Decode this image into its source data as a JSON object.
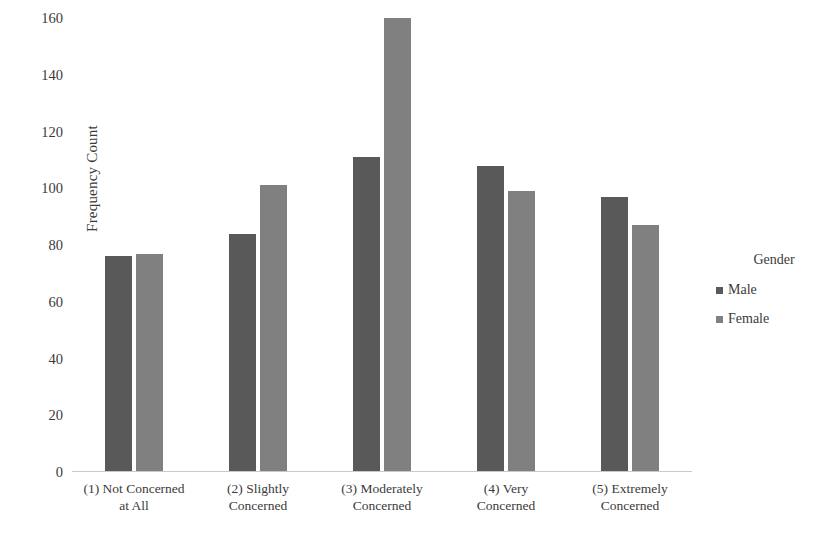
{
  "chart_data": {
    "type": "bar",
    "title": "",
    "xlabel": "",
    "ylabel": "Frequency Count",
    "ylim": [
      0,
      160
    ],
    "ytick_step": 20,
    "yticks": [
      0,
      20,
      40,
      60,
      80,
      100,
      120,
      140,
      160
    ],
    "grid": false,
    "legend_position": "right",
    "legend_title": "Gender",
    "categories": [
      "(1) Not Concerned at All",
      "(2) Slightly Concerned",
      "(3) Moderately Concerned",
      "(4) Very Concerned",
      "(5) Extremely Concerned"
    ],
    "category_lines": [
      [
        "(1) Not Concerned",
        "at All"
      ],
      [
        "(2) Slightly",
        "Concerned"
      ],
      [
        "(3) Moderately",
        "Concerned"
      ],
      [
        "(4) Very",
        "Concerned"
      ],
      [
        "(5) Extremely",
        "Concerned"
      ]
    ],
    "series": [
      {
        "name": "Male",
        "color": "#595959",
        "values": [
          76,
          84,
          111,
          108,
          97
        ]
      },
      {
        "name": "Female",
        "color": "#808080",
        "values": [
          77,
          101,
          160,
          99,
          87
        ]
      }
    ]
  },
  "colors": {
    "male": "#595959",
    "female": "#808080",
    "axis": "#c9c9c9",
    "text": "#3b3b3b",
    "background": "#ffffff"
  }
}
